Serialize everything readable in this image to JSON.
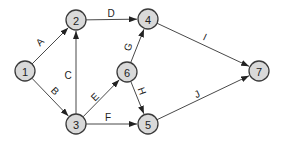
{
  "diagram": {
    "type": "directed-network",
    "nodes": [
      {
        "id": "1",
        "label": "1",
        "x": 25,
        "y": 71
      },
      {
        "id": "2",
        "label": "2",
        "x": 76,
        "y": 20
      },
      {
        "id": "3",
        "label": "3",
        "x": 76,
        "y": 124
      },
      {
        "id": "4",
        "label": "4",
        "x": 148,
        "y": 19
      },
      {
        "id": "5",
        "label": "5",
        "x": 148,
        "y": 124
      },
      {
        "id": "6",
        "label": "6",
        "x": 127,
        "y": 72
      },
      {
        "id": "7",
        "label": "7",
        "x": 259,
        "y": 71
      }
    ],
    "edges": [
      {
        "label": "A",
        "from": "1",
        "to": "2",
        "lx": 40,
        "ly": 42,
        "rot": -45
      },
      {
        "label": "B",
        "from": "1",
        "to": "3",
        "lx": 55,
        "ly": 91,
        "rot": 45
      },
      {
        "label": "C",
        "from": "3",
        "to": "2",
        "lx": 68,
        "ly": 75,
        "rot": 0
      },
      {
        "label": "D",
        "from": "2",
        "to": "4",
        "lx": 111,
        "ly": 13,
        "rot": 0
      },
      {
        "label": "E",
        "from": "3",
        "to": "6",
        "lx": 95,
        "ly": 97,
        "rot": -45
      },
      {
        "label": "F",
        "from": "3",
        "to": "5",
        "lx": 108,
        "ly": 117,
        "rot": 0
      },
      {
        "label": "G",
        "from": "6",
        "to": "4",
        "lx": 128,
        "ly": 47,
        "rot": -70
      },
      {
        "label": "H",
        "from": "6",
        "to": "5",
        "lx": 142,
        "ly": 91,
        "rot": 70
      },
      {
        "label": "I",
        "from": "4",
        "to": "7",
        "lx": 205,
        "ly": 37,
        "rot": 25
      },
      {
        "label": "J",
        "from": "5",
        "to": "7",
        "lx": 197,
        "ly": 94,
        "rot": -25
      }
    ],
    "colors": {
      "node_fill": "#d9d9d9",
      "node_stroke": "#3a3a3a",
      "edge": "#333333"
    }
  }
}
